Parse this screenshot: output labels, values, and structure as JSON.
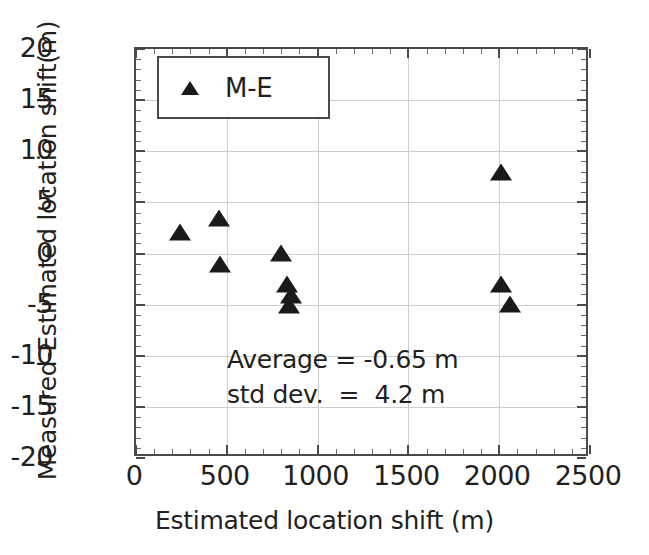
{
  "chart_data": {
    "type": "scatter",
    "title": "",
    "xlabel": "Estimated location shift (m)",
    "ylabel": "Measured-Estimated location shift(m)",
    "xlim": [
      0,
      2500
    ],
    "ylim": [
      -20,
      20
    ],
    "xticks": [
      0,
      500,
      1000,
      1500,
      2000,
      2500
    ],
    "yticks": [
      -20,
      -15,
      -10,
      -5,
      0,
      5,
      10,
      15,
      20
    ],
    "xtick_labels": [
      "0",
      "500",
      "1000",
      "1500",
      "2000",
      "2500"
    ],
    "ytick_labels": [
      "-20",
      "-15",
      "-10",
      "-5",
      "0",
      "5",
      "10",
      "15",
      "20"
    ],
    "x_minor_per_major": 5,
    "y_minor_per_major": 5,
    "grid": true,
    "legend_position": "top-left",
    "marker": "triangle-up",
    "marker_color": "#1a1a1a",
    "series": [
      {
        "name": "M-E",
        "points": [
          {
            "x": 240,
            "y": 1.9
          },
          {
            "x": 455,
            "y": 3.3
          },
          {
            "x": 460,
            "y": -1.2
          },
          {
            "x": 800,
            "y": -0.1
          },
          {
            "x": 830,
            "y": -3.2
          },
          {
            "x": 855,
            "y": -4.3
          },
          {
            "x": 845,
            "y": -5.2
          },
          {
            "x": 2010,
            "y": 7.8
          },
          {
            "x": 2010,
            "y": -3.2
          },
          {
            "x": 2060,
            "y": -5.1
          }
        ]
      }
    ],
    "annotations": [
      {
        "text": "Average = -0.65 m",
        "x": 880,
        "y": -11.5
      },
      {
        "text": "std dev.  =  4.2 m",
        "x": 880,
        "y": -14.2
      }
    ],
    "annotation_lines": [
      "Average = -0.65 m",
      "std dev.  =  4.2 m"
    ]
  },
  "legend": {
    "label": "M-E",
    "marker_name": "triangle-marker"
  },
  "axes": {
    "x_title": "Estimated location shift (m)",
    "y_title": "Measured-Estimated location shift(m)"
  }
}
